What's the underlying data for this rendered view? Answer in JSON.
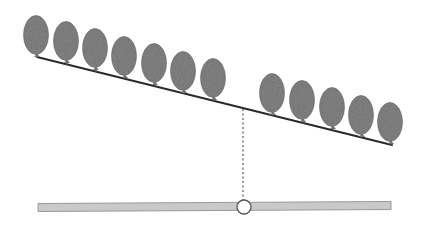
{
  "diagram": {
    "type": "balance-illustration",
    "width": 426,
    "height": 235,
    "colors": {
      "background": "#ffffff",
      "balloon_fill": "#737373",
      "balloon_stroke": "#5e5e5e",
      "beam": "#2a2a2a",
      "dashed": "#555555",
      "bar_fill": "#c9c9c9",
      "bar_stroke": "#9a9a9a",
      "pivot_fill": "#ffffff",
      "pivot_stroke": "#555555"
    },
    "beam": {
      "x1": 37,
      "y1": 57,
      "x2": 392,
      "y2": 145,
      "stroke_width": 2
    },
    "balloon_size": {
      "rx": 12.5,
      "ry": 19.5
    },
    "balloons": [
      {
        "cx": 36,
        "cy": 35,
        "side": "left"
      },
      {
        "cx": 66,
        "cy": 41,
        "side": "left"
      },
      {
        "cx": 95,
        "cy": 48,
        "side": "left"
      },
      {
        "cx": 124,
        "cy": 56,
        "side": "left"
      },
      {
        "cx": 154,
        "cy": 63,
        "side": "left"
      },
      {
        "cx": 183,
        "cy": 71,
        "side": "left"
      },
      {
        "cx": 213,
        "cy": 78,
        "side": "left"
      },
      {
        "cx": 272,
        "cy": 93,
        "side": "right"
      },
      {
        "cx": 302,
        "cy": 100,
        "side": "right"
      },
      {
        "cx": 332,
        "cy": 107,
        "side": "right"
      },
      {
        "cx": 361,
        "cy": 115,
        "side": "right"
      },
      {
        "cx": 390,
        "cy": 122,
        "side": "right"
      }
    ],
    "counts": {
      "left": 7,
      "right": 5
    },
    "plumb_line": {
      "x": 243,
      "y1": 109,
      "y2": 200
    },
    "base_bar": {
      "x1": 38,
      "y1": 203.5,
      "x2": 391,
      "y2": 201.5,
      "thickness": 8
    },
    "pivot": {
      "cx": 244,
      "cy": 207,
      "r": 7
    }
  }
}
